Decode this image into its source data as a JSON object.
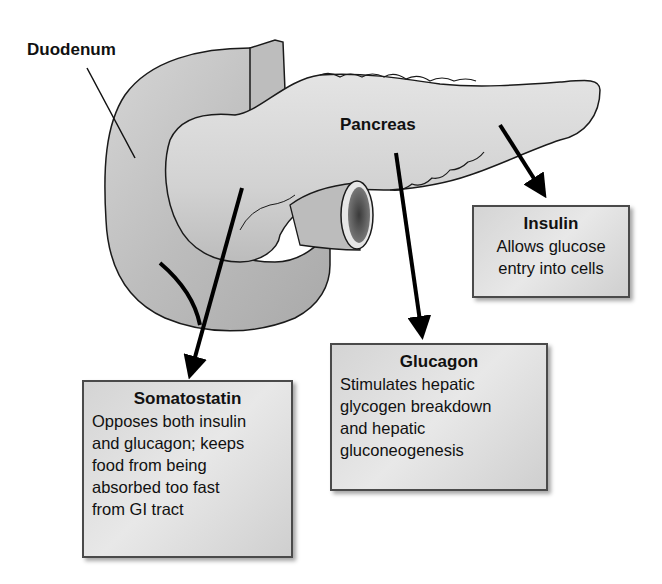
{
  "labels": {
    "duodenum": "Duodenum",
    "pancreas": "Pancreas"
  },
  "hormones": {
    "insulin": {
      "title": "Insulin",
      "lines": [
        "Allows glucose",
        "entry into cells"
      ]
    },
    "glucagon": {
      "title": "Glucagon",
      "lines": [
        "Stimulates hepatic",
        "glycogen breakdown",
        "and hepatic",
        "gluconeogenesis"
      ]
    },
    "somatostatin": {
      "title": "Somatostatin",
      "lines": [
        "Opposes both insulin",
        "and glucagon; keeps",
        "food from being",
        "absorbed too fast",
        "from GI tract"
      ]
    }
  },
  "colors": {
    "organ_fill": "#c9c9c9",
    "organ_light": "#e0e0e0",
    "outline": "#1a1a1a",
    "box_border": "#4a4a4a",
    "arrow": "#000000"
  }
}
